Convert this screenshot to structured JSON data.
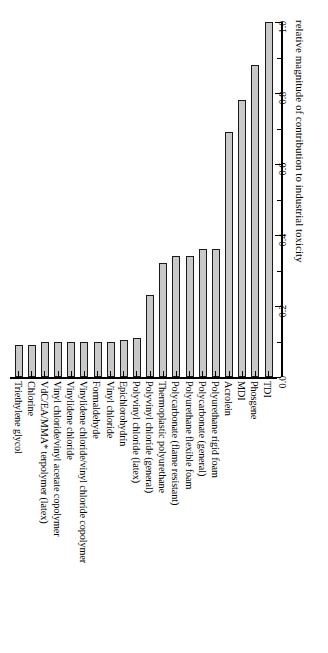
{
  "chart_data": {
    "type": "bar",
    "title": "",
    "subtitle": "",
    "orientation": "vertical-bars-rotated-page",
    "xlabel": "",
    "ylabel": "relative magnitude of contribution to industrial toxicity",
    "ylim": [
      0.0,
      1.0
    ],
    "grid": false,
    "legend": null,
    "tick_labels": [
      "0.0",
      "0.2",
      "0.4",
      "0.6",
      "0.8",
      "1.0"
    ],
    "tick_values": [
      0.0,
      0.2,
      0.4,
      0.6,
      0.8,
      1.0
    ],
    "minor_tick_values": [
      0.1,
      0.3,
      0.5,
      0.7,
      0.9
    ],
    "bar_color": "#c9c9c9",
    "bar_edge_color": "#1a1a1a",
    "categories": [
      "Triethylene glycol",
      "Chlorine",
      "VdC/EA/MMA* terpolymer (latex)",
      "Vinyl chloride/vinyl acetate copolymer",
      "Vinylidene chloride",
      "Vinylidene chloride/vinyl chloride copolymer",
      "Formaldehyde",
      "Vinyl chloride",
      "Epichlorohydrin",
      "Polyvinyl chloride (latex)",
      "Polyvinyl chloride (general)",
      "Thermoplastic polyurethane",
      "Polycarbonate (flame resistant)",
      "Polyurethane flexible foam",
      "Polycarbonate (general)",
      "Polyurethane rigid foam",
      "Acrolein",
      "MDI",
      "Phosgene",
      "TDI"
    ],
    "values": [
      0.09,
      0.09,
      0.1,
      0.1,
      0.1,
      0.1,
      0.1,
      0.1,
      0.105,
      0.11,
      0.23,
      0.32,
      0.34,
      0.34,
      0.36,
      0.36,
      0.69,
      0.78,
      0.88,
      1.0
    ]
  }
}
